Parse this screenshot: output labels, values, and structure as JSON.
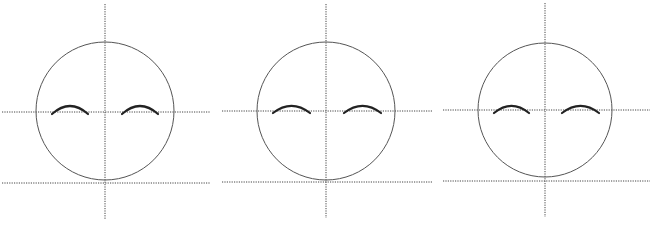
{
  "diagram": {
    "title": "",
    "colors": {
      "background": "#ffffff",
      "guide": "#444444",
      "head": "#555555",
      "eye": "#222222"
    },
    "faces": [
      {
        "label": "face-1",
        "head": {
          "cx": 105,
          "cy": 111,
          "r": 69
        },
        "vertical_guide": {
          "x": 105,
          "y1": 4,
          "y2": 219
        },
        "eye_line": {
          "y": 112,
          "x1": 2,
          "x2": 210
        },
        "chin_line": {
          "y": 183,
          "x1": 2,
          "x2": 210
        },
        "eyes": [
          {
            "x1": 52,
            "x2": 88,
            "y": 114,
            "peak": 104
          },
          {
            "x1": 122,
            "x2": 158,
            "y": 114,
            "peak": 104
          }
        ]
      },
      {
        "label": "face-2",
        "head": {
          "cx": 326,
          "cy": 111,
          "r": 69
        },
        "vertical_guide": {
          "x": 326,
          "y1": 4,
          "y2": 218
        },
        "eye_line": {
          "y": 111,
          "x1": 222,
          "x2": 432
        },
        "chin_line": {
          "y": 182,
          "x1": 222,
          "x2": 432
        },
        "eyes": [
          {
            "x1": 273,
            "x2": 310,
            "y": 113,
            "peak": 104
          },
          {
            "x1": 344,
            "x2": 381,
            "y": 113,
            "peak": 104
          }
        ]
      },
      {
        "label": "face-3",
        "head": {
          "cx": 545,
          "cy": 110,
          "r": 67
        },
        "vertical_guide": {
          "x": 545,
          "y1": 3,
          "y2": 217
        },
        "eye_line": {
          "y": 110,
          "x1": 443,
          "x2": 650
        },
        "chin_line": {
          "y": 181,
          "x1": 443,
          "x2": 650
        },
        "eyes": [
          {
            "x1": 494,
            "x2": 529,
            "y": 113,
            "peak": 104
          },
          {
            "x1": 562,
            "x2": 599,
            "y": 113,
            "peak": 104
          }
        ]
      }
    ]
  }
}
